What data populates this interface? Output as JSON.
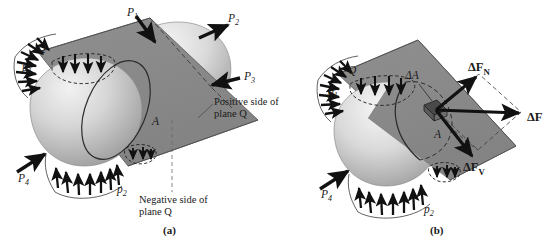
{
  "figure": {
    "background_color": "#ffffff",
    "plane_color": "#8a8a8a",
    "plane_edge_color": "#4a4a4a",
    "body_color": "#c9c9c9",
    "arrow_color": "#1a1a1a",
    "panels": [
      {
        "id": "panel-a",
        "caption": "(a)",
        "labels": {
          "plane_letter": "Q",
          "area_letter": "A",
          "pressure_top": "p",
          "pressure_top_sub": "1",
          "pressure_bottom": "p",
          "pressure_bottom_sub": "2",
          "force_1": "P",
          "force_1_sub": "1",
          "force_2": "P",
          "force_2_sub": "2",
          "force_3": "P",
          "force_3_sub": "3",
          "force_4": "P",
          "force_4_sub": "4",
          "positive_side_line1": "Positive side of",
          "positive_side_line2": "plane Q",
          "negative_side_line1": "Negative side of",
          "negative_side_line2": "plane Q"
        }
      },
      {
        "id": "panel-b",
        "caption": "(b)",
        "labels": {
          "plane_letter": "Q",
          "area_letter": "A",
          "delta_area": "ΔA",
          "pressure_top": "p",
          "pressure_top_sub": "1",
          "pressure_bottom": "p",
          "pressure_bottom_sub": "2",
          "force_4": "P",
          "force_4_sub": "4",
          "delta_force": "ΔF",
          "delta_force_normal": "ΔF",
          "delta_force_normal_sub": "N",
          "delta_force_shear": "ΔF",
          "delta_force_shear_sub": "V"
        }
      }
    ]
  }
}
